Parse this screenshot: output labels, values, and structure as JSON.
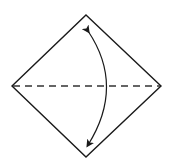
{
  "diagram": {
    "type": "origami-fold-step",
    "elements": {
      "paper": {
        "shape": "diamond",
        "stroke": "#1a1a1a"
      },
      "fold_line": {
        "style": "dashed",
        "kind": "valley-fold",
        "orientation": "horizontal",
        "stroke": "#333333"
      },
      "arrow": {
        "kind": "fold-and-unfold",
        "heads": "both",
        "stroke": "#1a1a1a"
      }
    }
  }
}
